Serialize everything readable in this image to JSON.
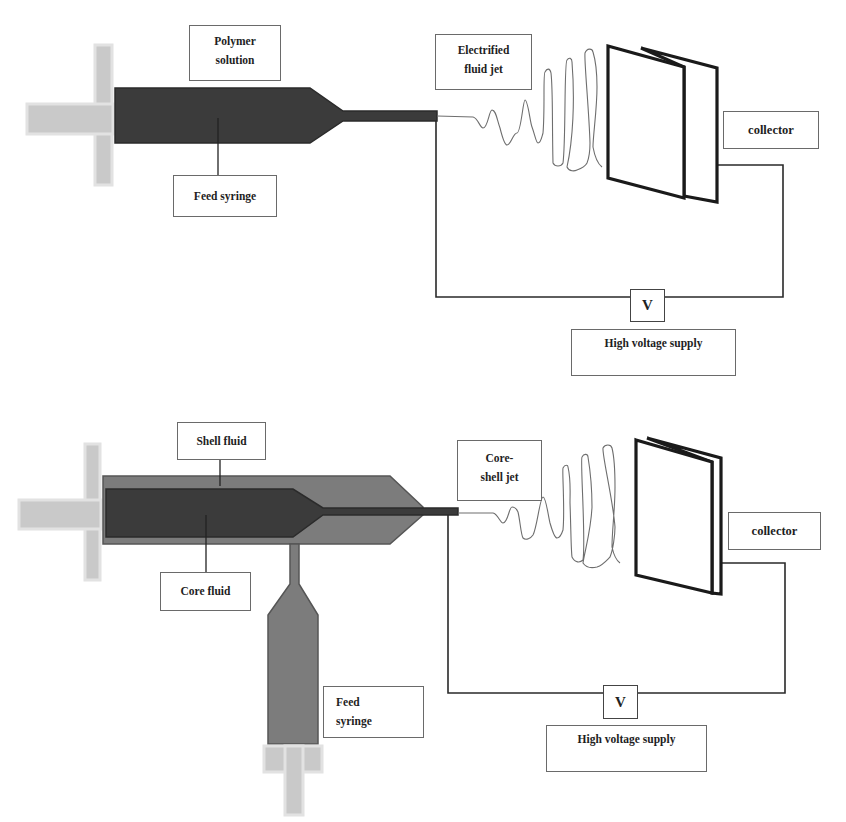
{
  "colors": {
    "syringe_dark": "#3b3b3b",
    "shell_gray": "#7c7c7c",
    "plunger_gray": "#c9c9c9",
    "plunger_outline": "#e2e2e2",
    "wire": "#2a2a2a",
    "jet": "#6e6e6e"
  },
  "top_setup": {
    "labels": {
      "polymer_solution": [
        "Polymer",
        "solution"
      ],
      "feed_syringe": [
        "Feed syringe"
      ],
      "electrified_jet": [
        "Electrified",
        "fluid jet"
      ],
      "collector": [
        "collector"
      ],
      "voltage_symbol": "V",
      "high_voltage_supply": [
        "High voltage supply"
      ]
    }
  },
  "bottom_setup": {
    "labels": {
      "shell_fluid": [
        "Shell fluid"
      ],
      "core_fluid": [
        "Core fluid"
      ],
      "core_shell_jet": [
        "Core-",
        "shell jet"
      ],
      "collector": [
        "collector"
      ],
      "feed_syringe": [
        "Feed",
        "syringe"
      ],
      "voltage_symbol": "V",
      "high_voltage_supply": [
        "High voltage supply"
      ]
    }
  }
}
